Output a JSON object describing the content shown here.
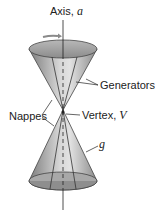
{
  "diagram": {
    "type": "double-napped cone",
    "labels": {
      "axis": "Axis, ",
      "axis_var": "a",
      "generators": "Generators",
      "nappes": "Nappes",
      "vertex": "Vertex, ",
      "vertex_var": "V",
      "generator_line": "g"
    },
    "colors": {
      "cone_fill": "#9a9a9a",
      "cone_light": "#d9d9d9",
      "arrow": "#8a8a8a",
      "line": "#222222"
    }
  }
}
